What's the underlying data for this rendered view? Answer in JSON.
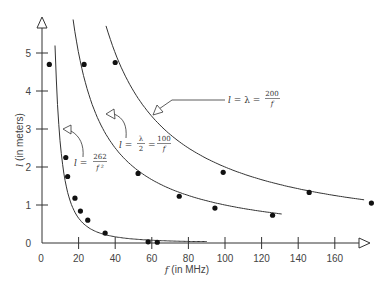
{
  "chart_data": {
    "type": "scatter",
    "title": "",
    "xlabel": "f (in MHz)",
    "ylabel": "l (in meters)",
    "xlim": [
      0,
      180
    ],
    "ylim": [
      0,
      5.6
    ],
    "x_ticks": [
      0,
      20,
      40,
      60,
      80,
      100,
      120,
      140,
      160
    ],
    "y_ticks": [
      0,
      1,
      2,
      3,
      4,
      5
    ],
    "grid": false,
    "legend": null,
    "series": [
      {
        "name": "measured points",
        "type": "scatter",
        "points": [
          [
            4,
            4.7
          ],
          [
            23,
            4.7
          ],
          [
            40,
            4.75
          ],
          [
            13,
            2.25
          ],
          [
            14,
            1.75
          ],
          [
            18,
            1.18
          ],
          [
            21,
            0.84
          ],
          [
            25,
            0.6
          ],
          [
            34.5,
            0.26
          ],
          [
            58,
            0.03
          ],
          [
            63,
            0.02
          ],
          [
            52.5,
            1.83
          ],
          [
            75,
            1.23
          ],
          [
            94.5,
            0.92
          ],
          [
            99,
            1.86
          ],
          [
            126,
            0.73
          ],
          [
            146,
            1.33
          ],
          [
            180,
            1.05
          ]
        ]
      },
      {
        "name": "l = 262/f^2",
        "type": "line",
        "formula": "262/f^2",
        "f_range": [
          7.1,
          90
        ]
      },
      {
        "name": "l = λ/2 = 100/f",
        "type": "line",
        "formula": "100/f",
        "f_range": [
          17,
          131
        ]
      },
      {
        "name": "l = λ = 200/f",
        "type": "line",
        "formula": "200/f",
        "f_range": [
          35,
          176
        ]
      }
    ],
    "annotations": [
      {
        "text": "l = λ = 200/f",
        "lhs": "l = λ = ",
        "num": "200",
        "den": "f"
      },
      {
        "text": "l = λ/2 = 100/f",
        "lhs": "l = ",
        "mid_num": "λ",
        "mid_den": "2",
        "num": "100",
        "den": "f"
      },
      {
        "text": "l = 262/f²",
        "lhs": "l = ",
        "num": "262",
        "den": "f ²"
      }
    ]
  },
  "axes": {
    "x_title": "f (in MHz)",
    "y_title": "l (in meters)",
    "x_tick_labels": [
      "0",
      "20",
      "40",
      "60",
      "80",
      "100",
      "120",
      "140",
      "160"
    ],
    "y_tick_labels": [
      "0",
      "1",
      "2",
      "3",
      "4",
      "5"
    ]
  },
  "colors": {
    "ink": "#333333",
    "background": "#ffffff"
  }
}
